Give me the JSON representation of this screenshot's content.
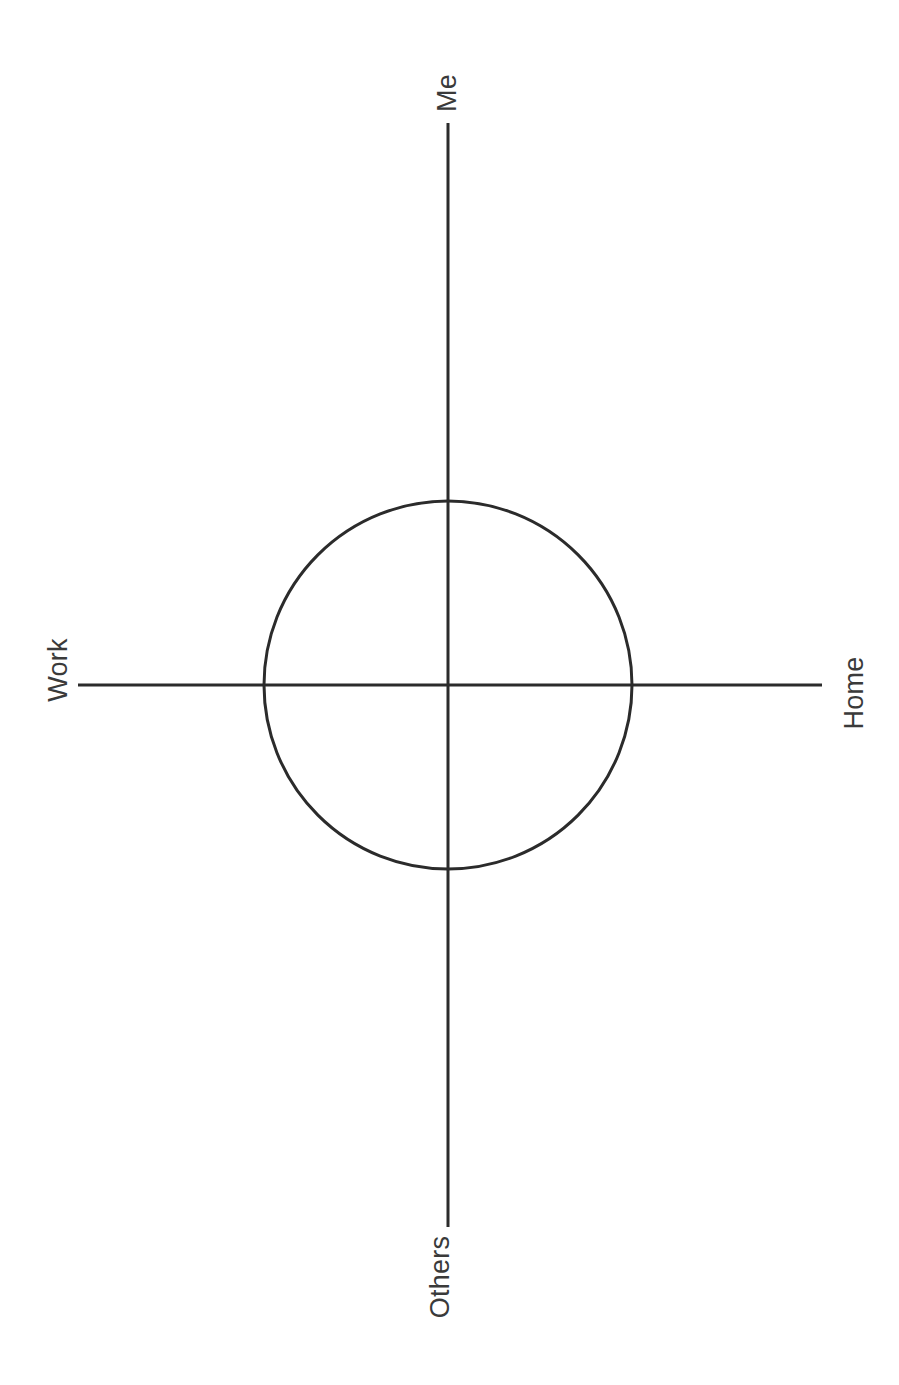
{
  "page": {
    "background_color": "#ffffff",
    "width": 899,
    "height": 1385
  },
  "diagram": {
    "type": "quadrant-axes-with-circle",
    "stroke_color": "#2b2b2b",
    "stroke_width": 3,
    "text_color": "#3a3a3a",
    "center": {
      "x": 448,
      "y": 685
    },
    "circle": {
      "cx": 448,
      "cy": 685,
      "r": 184,
      "fill": "none"
    },
    "vertical_axis": {
      "x": 448,
      "y1": 123,
      "y2": 1227
    },
    "horizontal_axis": {
      "y": 685,
      "x1": 78,
      "x2": 822
    }
  },
  "labels": {
    "top": "Me",
    "left": "Work",
    "right": "Home",
    "bottom": "Others"
  },
  "chart_data": {
    "type": "scatter",
    "title": "",
    "subtitle": "",
    "xlabel": "",
    "ylabel": "",
    "grid": false,
    "legend": null,
    "axes": [
      {
        "name": "vertical",
        "positive_end_label": "Me",
        "negative_end_label": "Others"
      },
      {
        "name": "horizontal",
        "positive_end_label": "Home",
        "negative_end_label": "Work"
      }
    ],
    "tick_labels": [],
    "annotations": [
      {
        "shape": "circle",
        "cx": 0,
        "cy": 0,
        "r": 184,
        "label": ""
      }
    ],
    "series": [],
    "x": [],
    "values": []
  }
}
